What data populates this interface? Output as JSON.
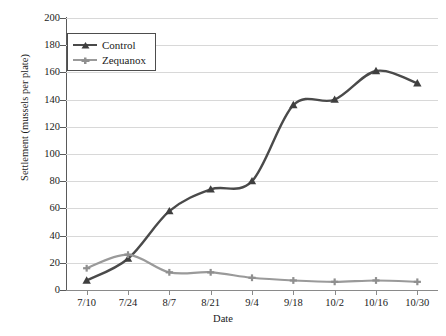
{
  "chart_data": {
    "type": "line",
    "title": "",
    "xlabel": "Date",
    "ylabel": "Settlement (mussels per plate)",
    "categories": [
      "7/10",
      "7/24",
      "8/7",
      "8/21",
      "9/4",
      "9/18",
      "10/2",
      "10/16",
      "10/30"
    ],
    "ylim": [
      0,
      200
    ],
    "ytick_step": 20,
    "yticks": [
      0,
      20,
      40,
      60,
      80,
      100,
      120,
      140,
      160,
      180,
      200
    ],
    "grid": "horizontal",
    "legend_position": "top-left",
    "series": [
      {
        "name": "Control",
        "color": "#4a4a4a",
        "marker": "triangle",
        "values": [
          7,
          23,
          58,
          74,
          80,
          136,
          140,
          161,
          152
        ]
      },
      {
        "name": "Zequanox",
        "color": "#9a9a9a",
        "marker": "plus",
        "values": [
          16,
          26,
          13,
          13,
          9,
          7,
          6,
          7,
          6
        ]
      }
    ]
  },
  "legend": {
    "items": [
      {
        "label": "Control"
      },
      {
        "label": "Zequanox"
      }
    ]
  }
}
